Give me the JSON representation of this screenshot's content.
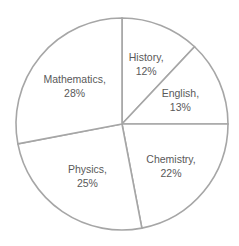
{
  "chart_data": {
    "type": "pie",
    "title": "",
    "start": "top",
    "direction": "clockwise",
    "slices": [
      {
        "label": "History",
        "value": 12,
        "text": "History,",
        "pct": "12%"
      },
      {
        "label": "English",
        "value": 13,
        "text": "English,",
        "pct": "13%"
      },
      {
        "label": "Chemistry",
        "value": 22,
        "text": "Chemistry,",
        "pct": "22%"
      },
      {
        "label": "Physics",
        "value": 25,
        "text": "Physics,",
        "pct": "25%"
      },
      {
        "label": "Mathematics",
        "value": 28,
        "text": "Mathematics,",
        "pct": "28%"
      }
    ],
    "colors": {
      "fill": "#ffffff",
      "stroke": "#a6a6a6",
      "text": "#595959"
    },
    "legend": "none"
  }
}
